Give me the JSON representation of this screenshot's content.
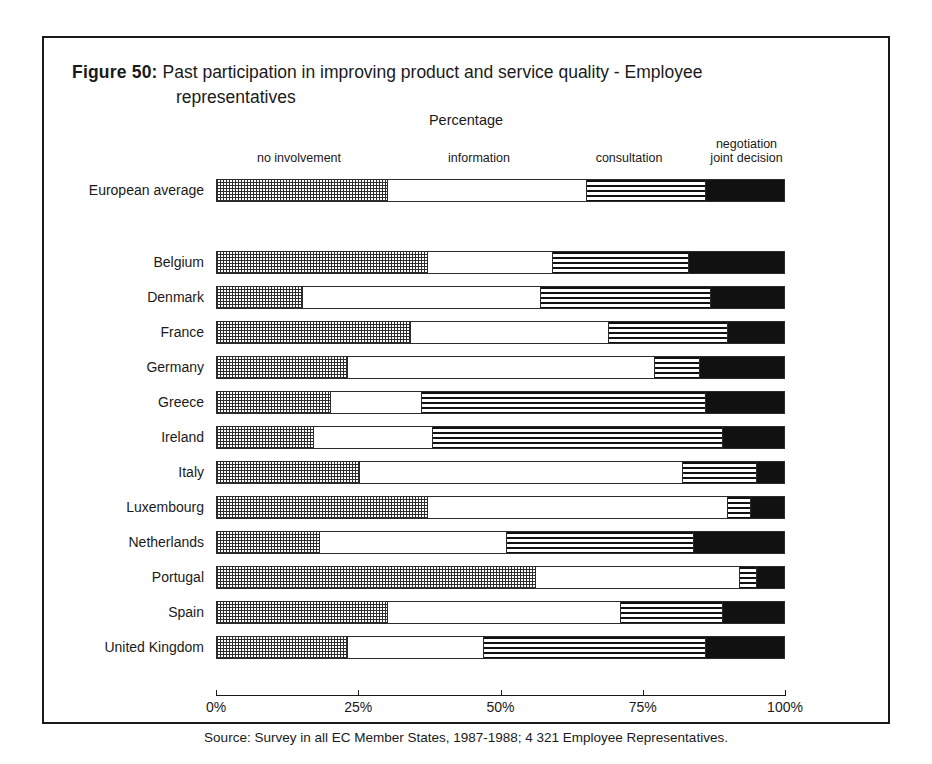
{
  "figure": {
    "number_label": "Figure 50:",
    "title_line1": "Past participation in improving product and service quality - Employee",
    "title_line2": "representatives",
    "axis_caption": "Percentage",
    "source": "Source: Survey in all EC Member States, 1987-1988; 4 321 Employee Representatives."
  },
  "legend": {
    "no_involvement": "no involvement",
    "information": "information",
    "consultation": "consultation",
    "negotiation_line1": "negotiation",
    "negotiation_line2": "joint decision"
  },
  "axis": {
    "ticks": [
      "0%",
      "25%",
      "50%",
      "75%",
      "100%"
    ],
    "values": [
      0,
      25,
      50,
      75,
      100
    ]
  },
  "chart_data": {
    "type": "bar",
    "orientation": "horizontal",
    "stacked": true,
    "normalized": true,
    "title": "Past participation in improving product and service quality - Employee representatives",
    "subtitle": "Percentage",
    "xlabel": "Percentage",
    "ylabel": "",
    "xlim": [
      0,
      100
    ],
    "xticks": [
      0,
      25,
      50,
      75,
      100
    ],
    "xticklabels": [
      "0%",
      "25%",
      "50%",
      "75%",
      "100%"
    ],
    "grid": false,
    "legend_position": "top",
    "source": "Source: Survey in all EC Member States, 1987-1988; 4 321 Employee Representatives.",
    "categories": [
      "European average",
      "Belgium",
      "Denmark",
      "France",
      "Germany",
      "Greece",
      "Ireland",
      "Italy",
      "Luxembourg",
      "Netherlands",
      "Portugal",
      "Spain",
      "United Kingdom"
    ],
    "series": [
      {
        "name": "no involvement",
        "pattern": "checkerboard-dots",
        "values": [
          30,
          37,
          15,
          34,
          23,
          20,
          17,
          25,
          37,
          18,
          56,
          30,
          23
        ]
      },
      {
        "name": "information",
        "pattern": "white",
        "values": [
          35,
          22,
          42,
          35,
          54,
          16,
          21,
          57,
          53,
          33,
          36,
          41,
          24
        ]
      },
      {
        "name": "consultation",
        "pattern": "horizontal-stripes",
        "values": [
          21,
          24,
          30,
          21,
          8,
          50,
          51,
          13,
          4,
          33,
          3,
          18,
          39
        ]
      },
      {
        "name": "negotiation joint decision",
        "pattern": "solid-black",
        "values": [
          14,
          17,
          13,
          10,
          15,
          14,
          11,
          5,
          6,
          16,
          5,
          11,
          14
        ]
      }
    ],
    "rows": [
      {
        "category": "European average",
        "no_involvement": 30,
        "information": 35,
        "consultation": 21,
        "negotiation_joint_decision": 14
      },
      {
        "category": "Belgium",
        "no_involvement": 37,
        "information": 22,
        "consultation": 24,
        "negotiation_joint_decision": 17
      },
      {
        "category": "Denmark",
        "no_involvement": 15,
        "information": 42,
        "consultation": 30,
        "negotiation_joint_decision": 13
      },
      {
        "category": "France",
        "no_involvement": 34,
        "information": 35,
        "consultation": 21,
        "negotiation_joint_decision": 10
      },
      {
        "category": "Germany",
        "no_involvement": 23,
        "information": 54,
        "consultation": 8,
        "negotiation_joint_decision": 15
      },
      {
        "category": "Greece",
        "no_involvement": 20,
        "information": 16,
        "consultation": 50,
        "negotiation_joint_decision": 14
      },
      {
        "category": "Ireland",
        "no_involvement": 17,
        "information": 21,
        "consultation": 51,
        "negotiation_joint_decision": 11
      },
      {
        "category": "Italy",
        "no_involvement": 25,
        "information": 57,
        "consultation": 13,
        "negotiation_joint_decision": 5
      },
      {
        "category": "Luxembourg",
        "no_involvement": 37,
        "information": 53,
        "consultation": 4,
        "negotiation_joint_decision": 6
      },
      {
        "category": "Netherlands",
        "no_involvement": 18,
        "information": 33,
        "consultation": 33,
        "negotiation_joint_decision": 16
      },
      {
        "category": "Portugal",
        "no_involvement": 56,
        "information": 36,
        "consultation": 3,
        "negotiation_joint_decision": 5
      },
      {
        "category": "Spain",
        "no_involvement": 30,
        "information": 41,
        "consultation": 18,
        "negotiation_joint_decision": 11
      },
      {
        "category": "United Kingdom",
        "no_involvement": 23,
        "information": 24,
        "consultation": 39,
        "negotiation_joint_decision": 14
      }
    ]
  }
}
